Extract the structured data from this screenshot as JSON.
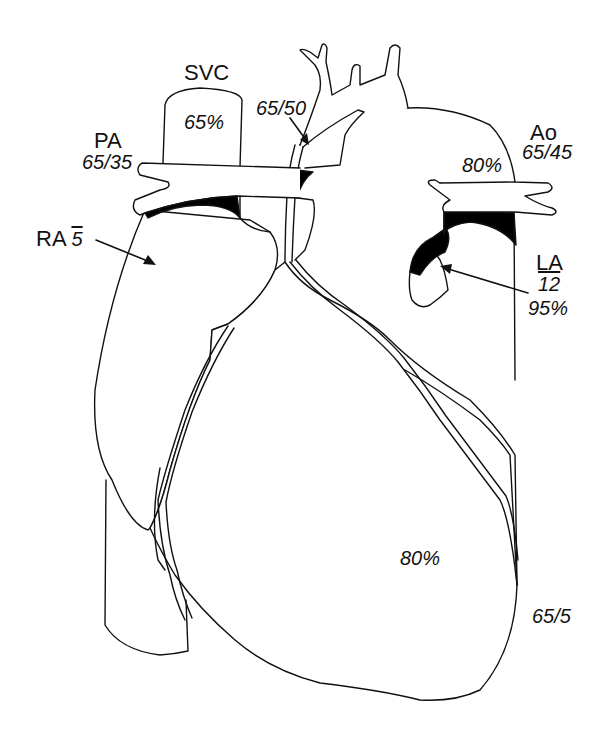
{
  "diagram": {
    "type": "heart-anatomy-line-drawing",
    "stroke_color": "#111111",
    "fill_color": "#ffffff",
    "shading_color": "#000000"
  },
  "labels": {
    "svc": {
      "name": "SVC",
      "saturation": "65%"
    },
    "pa": {
      "name": "PA",
      "pressure": "65/35"
    },
    "ra": {
      "name": "RA",
      "mean_pressure": "5"
    },
    "ductus": {
      "pressure": "65/50"
    },
    "ao": {
      "name": "Ao",
      "pressure": "65/45",
      "saturation": "80%"
    },
    "la": {
      "name": "LA",
      "mean_pressure": "12",
      "saturation": "95%"
    },
    "ventricle": {
      "saturation": "80%",
      "pressure": "65/5"
    }
  }
}
